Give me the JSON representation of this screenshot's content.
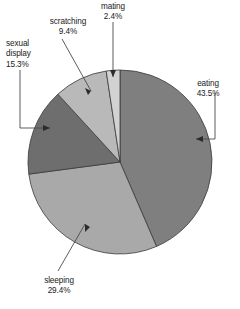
{
  "chart_data": {
    "type": "pie",
    "title": "",
    "subtitle": "",
    "xlabel": "",
    "ylabel": "",
    "legend_position": "none",
    "grid": false,
    "units": "percent",
    "labels_show_percent": true,
    "start_angle_deg": 0,
    "direction": "clockwise",
    "categories": [
      "eating",
      "sleeping",
      "sexual display",
      "scratching",
      "mating"
    ],
    "values": [
      43.5,
      29.4,
      15.3,
      9.4,
      2.4
    ],
    "total": 100.0,
    "slices": [
      {
        "label": "eating",
        "value": 43.5,
        "value_text": "43.5%",
        "color": "#7f7f7f",
        "label_line1": "eating",
        "label_line2": "43.5%"
      },
      {
        "label": "sleeping",
        "value": 29.4,
        "value_text": "29.4%",
        "color": "#a9a9a9",
        "label_line1": "sleeping",
        "label_line2": "29.4%"
      },
      {
        "label": "sexual display",
        "value": 15.3,
        "value_text": "15.3%",
        "color": "#6e6e6e",
        "label_line1": "sexual",
        "label_line2": "display",
        "label_line3": "15.3%"
      },
      {
        "label": "scratching",
        "value": 9.4,
        "value_text": "9.4%",
        "color": "#b9b9b9",
        "label_line1": "scratching",
        "label_line2": "9.4%"
      },
      {
        "label": "mating",
        "value": 2.4,
        "value_text": "2.4%",
        "color": "#d2d2d2",
        "label_line1": "mating",
        "label_line2": "2.4%"
      }
    ],
    "colors": {
      "eating": "#7f7f7f",
      "sleeping": "#a9a9a9",
      "sexual_display": "#6e6e6e",
      "scratching": "#b9b9b9",
      "mating": "#d2d2d2",
      "outline": "#3a3a3a",
      "leader": "#4a4a4a",
      "text": "#1a1a1a",
      "background": "#ffffff"
    },
    "geometry": {
      "center_x": 120,
      "center_y": 162,
      "radius": 92
    }
  }
}
